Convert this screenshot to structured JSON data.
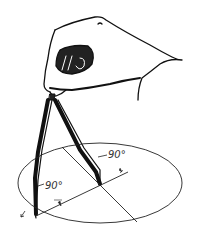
{
  "figure": {
    "labels": {
      "right_angle_top": "90°",
      "right_angle_bottom": "90°"
    },
    "colors": {
      "ink": "#111111",
      "background": "#ffffff"
    }
  }
}
